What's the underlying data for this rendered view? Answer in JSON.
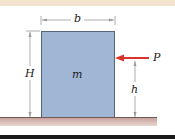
{
  "diagram": {
    "labels": {
      "width": "b",
      "height": "H",
      "mass": "m",
      "force": "P",
      "force_height": "h"
    },
    "colors": {
      "block": "#9fb6d4",
      "force_arrow": "#d9342b",
      "ground": "#c9a39c",
      "dimension_lines": "#999999"
    }
  }
}
